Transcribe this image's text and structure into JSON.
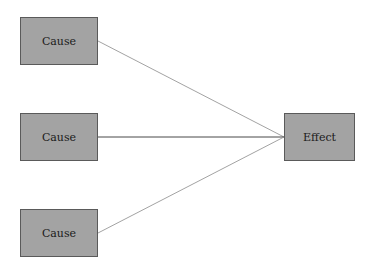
{
  "diagram": {
    "causes": [
      {
        "label": "Cause"
      },
      {
        "label": "Cause"
      },
      {
        "label": "Cause"
      }
    ],
    "effect": {
      "label": "Effect"
    },
    "colors": {
      "box_fill": "#a3a3a3",
      "box_border": "#5a5a5a",
      "line_top": "#8a8a8a",
      "line_middle": "#333333",
      "line_bottom": "#8a8a8a"
    }
  }
}
